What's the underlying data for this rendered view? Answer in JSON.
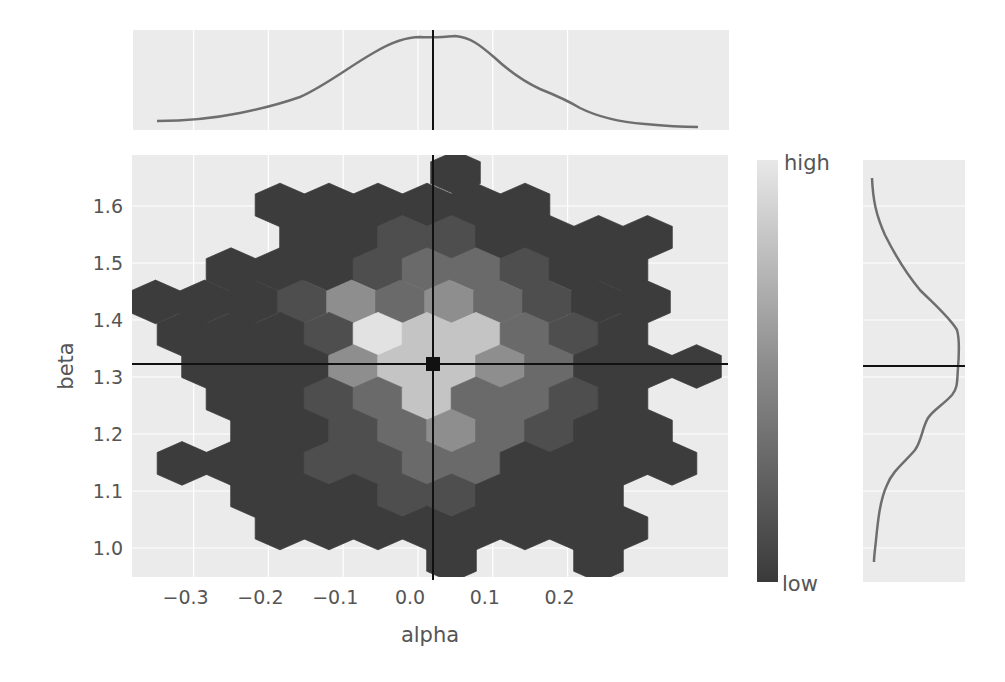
{
  "chart_data": {
    "type": "heatmap",
    "subtype": "hexbin-joint-plot",
    "xlabel": "alpha",
    "ylabel": "beta",
    "x_ticks": [
      -0.3,
      -0.2,
      -0.1,
      0.0,
      0.1,
      0.2
    ],
    "x_tick_labels": [
      "−0.3",
      "−0.2",
      "−0.1",
      "0.0",
      "0.1",
      "0.2"
    ],
    "y_ticks": [
      1.0,
      1.1,
      1.2,
      1.3,
      1.4,
      1.5,
      1.6
    ],
    "y_tick_labels": [
      "1.0",
      "1.1",
      "1.2",
      "1.3",
      "1.4",
      "1.5",
      "1.6"
    ],
    "xlim": [
      -0.385,
      0.285
    ],
    "ylim": [
      0.95,
      1.685
    ],
    "reference_point": {
      "alpha": -0.045,
      "beta": 1.325
    },
    "colorbar": {
      "high_label": "high",
      "low_label": "low",
      "high_color": "#e8e8e8",
      "low_color": "#3a3a3a"
    },
    "grid": true,
    "marginals": {
      "top": {
        "variable": "alpha",
        "shape": "unimodal, flat-topped peak near -0.045"
      },
      "right": {
        "variable": "beta",
        "shape": "peak near 1.32 with shoulder near 1.17"
      }
    },
    "hex_rows": [
      {
        "row": -1,
        "cells": [
          [
            455.5,
            1
          ]
        ]
      },
      {
        "row": 0,
        "cells": [
          [
            280,
            1
          ],
          [
            329,
            1
          ],
          [
            378,
            1
          ],
          [
            427,
            1
          ],
          [
            476,
            1
          ],
          [
            525,
            1
          ]
        ]
      },
      {
        "row": 1,
        "cells": [
          [
            304.5,
            1
          ],
          [
            353.5,
            1
          ],
          [
            402.5,
            2
          ],
          [
            451.5,
            2
          ],
          [
            500.5,
            1
          ],
          [
            549.5,
            1
          ],
          [
            598.5,
            1
          ],
          [
            647.5,
            1
          ]
        ]
      },
      {
        "row": 2,
        "cells": [
          [
            231,
            1
          ],
          [
            280,
            1
          ],
          [
            329,
            1
          ],
          [
            378,
            2
          ],
          [
            427,
            3
          ],
          [
            476,
            3
          ],
          [
            525,
            2
          ],
          [
            574,
            1
          ],
          [
            623,
            1
          ]
        ]
      },
      {
        "row": 3,
        "cells": [
          [
            155.5,
            1
          ],
          [
            204.5,
            1
          ],
          [
            253.5,
            1
          ],
          [
            302.5,
            2
          ],
          [
            351.5,
            4
          ],
          [
            400.5,
            3
          ],
          [
            449.5,
            4
          ],
          [
            498.5,
            3
          ],
          [
            547.5,
            2
          ],
          [
            596.5,
            1
          ],
          [
            645.5,
            1
          ]
        ]
      },
      {
        "row": 4,
        "cells": [
          [
            182,
            1
          ],
          [
            231,
            1
          ],
          [
            280,
            1
          ],
          [
            329,
            2
          ],
          [
            378,
            6
          ],
          [
            427,
            5
          ],
          [
            476,
            5
          ],
          [
            525,
            3
          ],
          [
            574,
            2
          ],
          [
            623,
            1
          ]
        ]
      },
      {
        "row": 5,
        "cells": [
          [
            206.5,
            1
          ],
          [
            255.5,
            1
          ],
          [
            304.5,
            1
          ],
          [
            353.5,
            4
          ],
          [
            402.5,
            5
          ],
          [
            451.5,
            5
          ],
          [
            500.5,
            4
          ],
          [
            549.5,
            3
          ],
          [
            598.5,
            1
          ],
          [
            647.5,
            1
          ],
          [
            696.5,
            1
          ]
        ]
      },
      {
        "row": 6,
        "cells": [
          [
            231,
            1
          ],
          [
            280,
            1
          ],
          [
            329,
            2
          ],
          [
            378,
            3
          ],
          [
            427,
            5
          ],
          [
            476,
            3
          ],
          [
            525,
            3
          ],
          [
            574,
            2
          ],
          [
            623,
            1
          ]
        ]
      },
      {
        "row": 7,
        "cells": [
          [
            255.5,
            1
          ],
          [
            304.5,
            1
          ],
          [
            353.5,
            2
          ],
          [
            402.5,
            3
          ],
          [
            451.5,
            4
          ],
          [
            500.5,
            3
          ],
          [
            549.5,
            2
          ],
          [
            598.5,
            1
          ],
          [
            647.5,
            1
          ]
        ]
      },
      {
        "row": 8,
        "cells": [
          [
            182,
            1
          ],
          [
            231,
            1
          ],
          [
            280,
            1
          ],
          [
            329,
            2
          ],
          [
            378,
            2
          ],
          [
            427,
            3
          ],
          [
            476,
            3
          ],
          [
            525,
            1
          ],
          [
            574,
            1
          ],
          [
            623,
            1
          ],
          [
            672,
            1
          ]
        ]
      },
      {
        "row": 9,
        "cells": [
          [
            255.5,
            1
          ],
          [
            304.5,
            1
          ],
          [
            353.5,
            1
          ],
          [
            402.5,
            2
          ],
          [
            451.5,
            2
          ],
          [
            500.5,
            1
          ],
          [
            549.5,
            1
          ],
          [
            598.5,
            1
          ]
        ]
      },
      {
        "row": 10,
        "cells": [
          [
            280,
            1
          ],
          [
            329,
            1
          ],
          [
            378,
            1
          ],
          [
            427,
            1
          ],
          [
            476,
            1
          ],
          [
            525,
            1
          ],
          [
            574,
            1
          ],
          [
            623,
            1
          ]
        ]
      },
      {
        "row": 11,
        "cells": [
          [
            451.5,
            1
          ],
          [
            598.5,
            1
          ]
        ]
      }
    ],
    "density_levels": {
      "1": "#3c3c3c",
      "2": "#4e4e4e",
      "3": "#6a6a6a",
      "4": "#8e8e8e",
      "5": "#c4c4c4",
      "6": "#e2e2e2"
    }
  },
  "axes": {
    "xlabel": "alpha",
    "ylabel": "beta"
  },
  "colorbar": {
    "high": "high",
    "low": "low"
  }
}
